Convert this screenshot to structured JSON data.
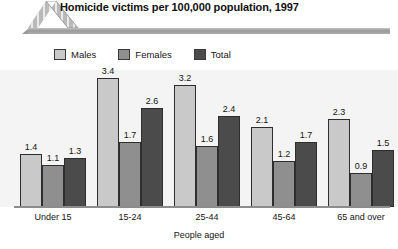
{
  "header": {
    "title": "Homicide victims per 100,000 population, 1997",
    "logo_name": "striped-chevron-logo"
  },
  "legend": {
    "position": "top-left",
    "entries": [
      {
        "label": "Males",
        "color": "#c9c9c9"
      },
      {
        "label": "Females",
        "color": "#8f8f8f"
      },
      {
        "label": "Total",
        "color": "#4b4b4b"
      }
    ]
  },
  "chart_data": {
    "type": "bar",
    "title": "Homicide victims per 100,000 population, 1997",
    "subtitle": "",
    "xlabel": "People aged",
    "ylabel": "",
    "ylim": [
      0,
      3.6
    ],
    "grid": false,
    "legend_position": "top-left",
    "categories": [
      "Under 15",
      "15-24",
      "25-44",
      "45-64",
      "65 and over"
    ],
    "series": [
      {
        "name": "Males",
        "color": "#c9c9c9",
        "values": [
          1.4,
          3.4,
          3.2,
          2.1,
          2.3
        ]
      },
      {
        "name": "Females",
        "color": "#8f8f8f",
        "values": [
          1.1,
          1.7,
          1.6,
          1.2,
          0.9
        ]
      },
      {
        "name": "Total",
        "color": "#4b4b4b",
        "values": [
          1.3,
          2.6,
          2.4,
          1.7,
          1.5
        ]
      }
    ],
    "data_labels": [
      [
        "1.4",
        "1.1",
        "1.3"
      ],
      [
        "3.4",
        "1.7",
        "2.6"
      ],
      [
        "3.2",
        "1.6",
        "2.4"
      ],
      [
        "2.1",
        "1.2",
        "1.7"
      ],
      [
        "2.3",
        "0.9",
        "1.5"
      ]
    ]
  }
}
